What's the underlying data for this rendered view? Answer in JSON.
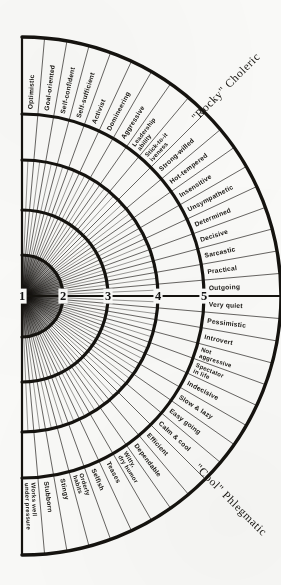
{
  "figure": {
    "title_top_right": "\"Rocky\" Choleric",
    "title_bottom_right": "\"Cool\" Phlegmatic",
    "center_x": 22,
    "center_y": 296,
    "axis_numbers": [
      "1",
      "2",
      "3",
      "4",
      "5"
    ],
    "ring_radii": [
      0,
      41,
      86,
      136,
      182,
      259
    ],
    "label_band_inner_radius": 182,
    "label_band_outer_radius": 259,
    "sector_count": 36,
    "line_color": "#15130f",
    "background_color": "#fbfbf9"
  },
  "segments_top": [
    "Optimistic",
    "Goal-oriented",
    "Self-confident",
    "Self-sufficient",
    "Activist",
    "Domineering",
    "Aggressive",
    "Leadership ability",
    "Stick-to-it iveness",
    "Strong-willed",
    "Hot-tempered",
    "Insensitive",
    "Unsympathetic",
    "Determined",
    "Decisive",
    "Sarcastic",
    "Practical",
    "Outgoing"
  ],
  "segments_bottom": [
    "Very quiet",
    "Pessimistic",
    "Introvert",
    "Not aggressive",
    "Spectator in life",
    "Indecisive",
    "Slow & lazy",
    "Easy going",
    "Calm & cool",
    "Efficient",
    "Dependable",
    "Witty, dry humor",
    "Teases",
    "Selfish",
    "Orderly habits",
    "Stingy",
    "Stubborn",
    "Works well under pressure"
  ],
  "chart_data": {
    "type": "pie",
    "subtitle": "Semicircular radial chart, 36 trait sectors over 5 concentric intensity rings",
    "xlabel": "",
    "ylabel": "Intensity ring",
    "grid": true,
    "legend_position": "none",
    "axis_ticks": [
      "1",
      "2",
      "3",
      "4",
      "5"
    ],
    "radial_scale_min": 1,
    "radial_scale_max": 5,
    "annotations": [
      "\"Rocky\" Choleric",
      "\"Cool\" Phlegmatic"
    ],
    "categories": [
      "Optimistic",
      "Goal-oriented",
      "Self-confident",
      "Self-sufficient",
      "Activist",
      "Domineering",
      "Aggressive",
      "Leadership ability",
      "Stick-to-it iveness",
      "Strong-willed",
      "Hot-tempered",
      "Insensitive",
      "Unsympathetic",
      "Determined",
      "Decisive",
      "Sarcastic",
      "Practical",
      "Outgoing",
      "Very quiet",
      "Pessimistic",
      "Introvert",
      "Not aggressive",
      "Spectator in life",
      "Indecisive",
      "Slow & lazy",
      "Easy going",
      "Calm & cool",
      "Efficient",
      "Dependable",
      "Witty, dry humor",
      "Teases",
      "Selfish",
      "Orderly habits",
      "Stingy",
      "Stubborn",
      "Works well under pressure"
    ],
    "values": [
      5,
      5,
      5,
      5,
      5,
      5,
      5,
      5,
      5,
      5,
      5,
      5,
      5,
      5,
      5,
      5,
      5,
      5,
      5,
      5,
      5,
      5,
      5,
      5,
      5,
      5,
      5,
      5,
      5,
      5,
      5,
      5,
      5,
      5,
      5,
      5
    ]
  }
}
